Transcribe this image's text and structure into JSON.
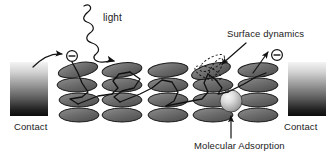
{
  "figure": {
    "type": "scientific-schematic",
    "background_color": "#ffffff",
    "width": 335,
    "height": 163
  },
  "labels": {
    "light": "light",
    "surface_dynamics": "Surface dynamics",
    "molecular_adsorption": "Molecular Adsorption",
    "contact_left": "Contact",
    "contact_right": "Contact"
  },
  "colors": {
    "disc_fill": "#6f6f6f",
    "disc_stroke": "#1a1a1a",
    "contact_top": "#f2f2f2",
    "contact_bottom": "#111111",
    "sphere_light": "#e8e8e8",
    "sphere_dark": "#8e8e8e",
    "line": "#111111",
    "text": "#1b1b1b"
  },
  "contacts": [
    {
      "id": "contact-left",
      "x": 10,
      "y": 62,
      "width": 38,
      "height": 54,
      "label": "Contact"
    },
    {
      "id": "contact-right",
      "x": 288,
      "y": 62,
      "width": 38,
      "height": 54,
      "label": "Contact"
    }
  ],
  "disc_columns": [
    {
      "id": "column-1",
      "cx": 79,
      "rows": [
        70,
        85,
        100,
        115
      ]
    },
    {
      "id": "column-2",
      "cx": 122,
      "rows": [
        70,
        85,
        100,
        115
      ]
    },
    {
      "id": "column-3",
      "cx": 168,
      "rows": [
        70,
        85,
        100,
        115
      ]
    },
    {
      "id": "column-4",
      "cx": 213,
      "rows": [
        70,
        85,
        100,
        115
      ]
    },
    {
      "id": "column-5",
      "cx": 258,
      "rows": [
        70,
        85,
        100,
        115
      ]
    }
  ],
  "disc_geometry": {
    "rx": 20,
    "ry": 7
  },
  "electrons": [
    {
      "id": "electron-in",
      "cx": 72,
      "cy": 56,
      "r": 5.5,
      "glyph": "minus-in-circle"
    },
    {
      "id": "electron-out",
      "cx": 277,
      "cy": 55,
      "r": 5.5,
      "glyph": "minus-in-circle"
    }
  ],
  "molecular_sphere": {
    "cx": 231,
    "cy": 101,
    "r": 11
  },
  "surface_dynamics_marker": {
    "cx": 211,
    "cy": 70,
    "note": "dashed ellipse outlines indicating disc motion"
  },
  "annotations": [
    {
      "id": "light-wave",
      "kind": "squiggly-arrow",
      "from": [
        83,
        6
      ],
      "to": [
        135,
        63
      ]
    },
    {
      "id": "electron-in-arrow",
      "kind": "curved-arrow",
      "from": [
        34,
        66
      ],
      "to": [
        64,
        56
      ]
    },
    {
      "id": "electron-out-arrow",
      "kind": "arrow",
      "from": [
        258,
        71
      ],
      "to": [
        268,
        52
      ]
    },
    {
      "id": "surface-dynamics-pointer",
      "kind": "arrow",
      "from": [
        244,
        45
      ],
      "to": [
        219,
        66
      ]
    },
    {
      "id": "molecular-adsorption-pointer",
      "kind": "arrow",
      "from": [
        231,
        139
      ],
      "to": [
        231,
        114
      ]
    }
  ],
  "transport_path": {
    "id": "electron-transport-path",
    "description": "Polyline hopping path from left electron across disc columns to right electron"
  }
}
